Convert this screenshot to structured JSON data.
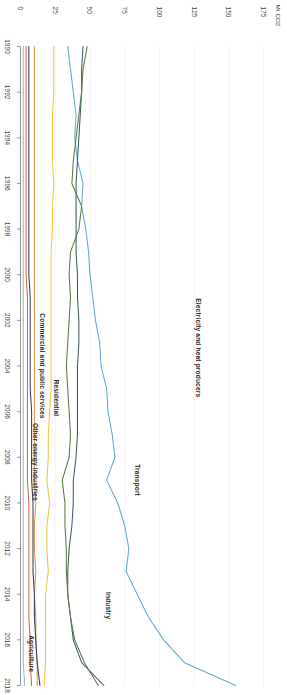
{
  "chart_data": {
    "type": "line",
    "title": "",
    "subtitle": "",
    "xlabel": "",
    "ylabel": "Mt CO2",
    "x": [
      1990,
      1991,
      1992,
      1993,
      1994,
      1995,
      1996,
      1997,
      1998,
      1999,
      2000,
      2001,
      2002,
      2003,
      2004,
      2005,
      2006,
      2007,
      2008,
      2009,
      2010,
      2011,
      2012,
      2013,
      2014,
      2015,
      2016,
      2017,
      2018
    ],
    "xlim": [
      1990,
      2018
    ],
    "ylim": [
      0,
      185
    ],
    "yticks": [
      0,
      25,
      50,
      75,
      100,
      125,
      150,
      175
    ],
    "ytick_labels": [
      "0",
      "25",
      "50",
      "75",
      "100",
      "125",
      "150",
      "175"
    ],
    "xticks": [
      1990,
      1992,
      1994,
      1996,
      1998,
      2000,
      2002,
      2004,
      2006,
      2008,
      2010,
      2012,
      2014,
      2016,
      2018
    ],
    "xtick_labels": [
      "1990",
      "1992",
      "1994",
      "1996",
      "1998",
      "2000",
      "2002",
      "2004",
      "2006",
      "2008",
      "2010",
      "2012",
      "2014",
      "2016",
      "2018"
    ],
    "grid": true,
    "grid_axis": "y",
    "legend": "inline-annotations",
    "series": [
      {
        "name": "Electricity and heat producers",
        "color": "#5fa8cf",
        "label_x": 2003.2,
        "label_y": 128,
        "values": [
          34,
          36,
          38,
          40,
          39,
          41,
          45,
          44,
          47,
          49,
          50,
          52,
          54,
          57,
          58,
          62,
          63,
          66,
          68,
          62,
          70,
          75,
          78,
          76,
          84,
          92,
          103,
          118,
          155
        ]
      },
      {
        "name": "Transport",
        "color": "#3e5c5c",
        "label_x": 2009.0,
        "label_y": 84,
        "values": [
          45,
          44,
          44,
          43,
          42,
          41,
          40,
          40,
          40,
          40,
          41,
          41,
          42,
          42,
          41,
          41,
          41,
          41,
          40,
          38,
          38,
          37,
          35,
          34,
          34,
          36,
          38,
          44,
          60
        ]
      },
      {
        "name": "Industry",
        "color": "#5c7a44",
        "label_x": 2014.5,
        "label_y": 63,
        "values": [
          48,
          45,
          44,
          42,
          40,
          38,
          37,
          44,
          42,
          36,
          35,
          36,
          35,
          34,
          33,
          34,
          35,
          36,
          35,
          30,
          32,
          32,
          33,
          33,
          34,
          36,
          39,
          46,
          56
        ]
      },
      {
        "name": "Residential",
        "color": "#e8c93a",
        "label_x": 2005.4,
        "label_y": 26,
        "values": [
          24,
          24,
          24,
          23,
          23,
          23,
          24,
          23,
          23,
          22,
          22,
          22,
          22,
          22,
          22,
          22,
          21,
          20,
          20,
          19,
          21,
          19,
          19,
          20,
          18,
          18,
          18,
          18,
          17
        ]
      },
      {
        "name": "Commercial and public services",
        "color": "#e8913c",
        "label_x": 2004.0,
        "label_y": 16,
        "values": [
          10,
          10,
          10,
          10,
          10,
          10,
          10,
          10,
          10,
          10,
          10,
          10,
          10,
          10,
          10,
          10,
          10,
          10,
          10,
          10,
          11,
          10,
          10,
          11,
          10,
          11,
          11,
          12,
          12
        ]
      },
      {
        "name": "Other energy industries",
        "color": "#2f3f63",
        "label_x": 2008.2,
        "label_y": 11,
        "values": [
          6,
          6,
          6,
          6,
          6,
          6,
          6,
          6,
          6,
          6,
          6,
          7,
          7,
          7,
          7,
          7,
          8,
          8,
          8,
          8,
          9,
          9,
          9,
          9,
          10,
          10,
          11,
          12,
          14
        ]
      },
      {
        "name": "Agriculture",
        "color": "#d4654a",
        "label_x": 2016.6,
        "label_y": 8,
        "values": [
          4,
          4,
          4,
          4,
          4,
          4,
          4,
          4,
          4,
          4,
          4,
          5,
          5,
          5,
          5,
          5,
          5,
          5,
          5,
          5,
          6,
          6,
          6,
          6,
          6,
          6,
          7,
          7,
          8
        ]
      },
      {
        "name": "Fugitive emissions",
        "color": "#9fb8c4",
        "label_x": null,
        "label_y": null,
        "values": [
          2,
          2,
          2,
          2,
          2,
          2,
          2,
          2,
          2,
          2,
          2,
          2,
          2,
          2,
          2,
          2,
          2,
          2,
          2,
          2,
          2,
          2,
          2,
          2,
          2,
          2,
          2,
          2,
          3
        ]
      }
    ]
  }
}
